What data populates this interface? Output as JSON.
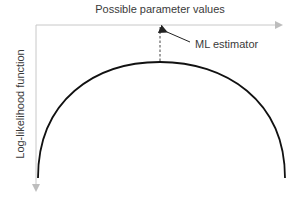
{
  "diagram": {
    "x_axis_label": "Possible parameter values",
    "y_axis_label": "Log-likelihood function",
    "annotation": "ML estimator",
    "colors": {
      "axis": "#c8c8c8",
      "curve": "#111111",
      "text": "#3a3a3a",
      "dashed": "#444444",
      "pointer": "#222222"
    },
    "curve_shape": "concave semi-ellipse with single maximum",
    "peak": {
      "x": 160,
      "y": 62
    }
  }
}
